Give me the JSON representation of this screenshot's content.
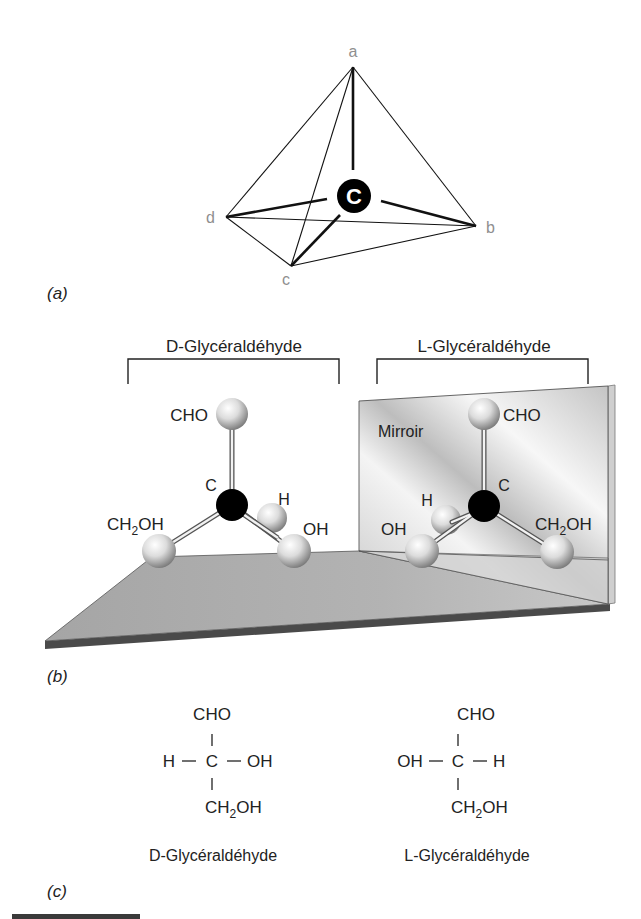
{
  "figure": {
    "panels": {
      "a": {
        "label": "(a)",
        "center_atom": "C",
        "vertices": {
          "a": "a",
          "b": "b",
          "c": "c",
          "d": "d"
        }
      },
      "b": {
        "label": "(b)",
        "left_title": "D-Glycéraldéhyde",
        "right_title": "L-Glycéraldéhyde",
        "mirror_label": "Mirroir",
        "d_model": {
          "top": "CHO",
          "center": "C",
          "h": "H",
          "right": "OH",
          "left_main": "CH",
          "left_sub": "2",
          "left_tail": "OH"
        },
        "l_model": {
          "top": "CHO",
          "center": "C",
          "h": "H",
          "left": "OH",
          "right_main": "CH",
          "right_sub": "2",
          "right_tail": "OH"
        }
      },
      "c": {
        "label": "(c)",
        "d_formula": {
          "top": "CHO",
          "left": "H",
          "center": "C",
          "right": "OH",
          "bottom_main": "CH",
          "bottom_sub": "2",
          "bottom_tail": "OH",
          "bond_h": "—",
          "bond_v": "|"
        },
        "l_formula": {
          "top": "CHO",
          "left": "OH",
          "center": "C",
          "right": "H",
          "bottom_main": "CH",
          "bottom_sub": "2",
          "bottom_tail": "OH",
          "bond_h": "—",
          "bond_v": "|"
        },
        "d_caption": "D-Glycéraldéhyde",
        "l_caption": "L-Glycéraldéhyde"
      }
    }
  },
  "colors": {
    "floor": "#a9a9a9",
    "floor_edge": "#4a4a4a",
    "mirror": "#d9d9d9",
    "atom_carbon": "#000000",
    "atom_sphere": "#e6e6e6",
    "vertex_label": "#8f8f8f"
  }
}
